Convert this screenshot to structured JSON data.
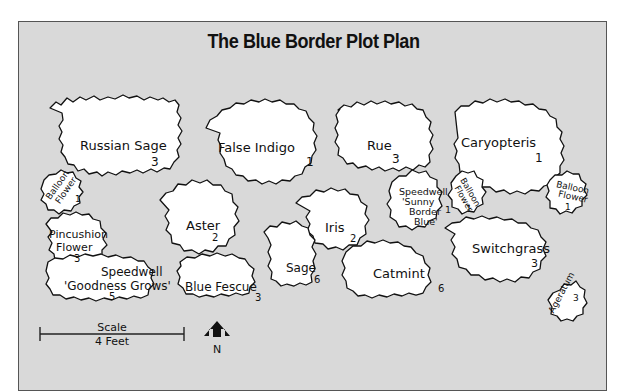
{
  "title": "The Blue Border Plot Plan",
  "colors": {
    "background": "#d9d9d9",
    "plant_fill": "#ffffff",
    "outline": "#111111",
    "frame_border": "#555555"
  },
  "plants": [
    {
      "id": "russian-sage",
      "name": "Russian Sage",
      "count": "3"
    },
    {
      "id": "false-indigo",
      "name": "False Indigo",
      "count": "1"
    },
    {
      "id": "rue",
      "name": "Rue",
      "count": "3"
    },
    {
      "id": "caryopteris",
      "name": "Caryopteris",
      "count": "1"
    },
    {
      "id": "balloon-flower-left",
      "name_lines": [
        "Balloon",
        "Flower"
      ],
      "count": "1"
    },
    {
      "id": "pincushion-flower",
      "name_lines": [
        "Pincushion",
        "Flower"
      ],
      "count": "3"
    },
    {
      "id": "aster",
      "name": "Aster",
      "count": "2"
    },
    {
      "id": "iris",
      "name": "Iris",
      "count": "2"
    },
    {
      "id": "speedwell-sunny",
      "name_lines": [
        "Speedwell",
        "'Sunny",
        "Border",
        "Blue'"
      ],
      "count": "1"
    },
    {
      "id": "balloon-flower-mid",
      "name_lines": [
        "Balloon",
        "Flower"
      ],
      "count": "1"
    },
    {
      "id": "balloon-flower-right",
      "name_lines": [
        "Balloon",
        "Flower"
      ],
      "count": "1"
    },
    {
      "id": "switchgrass",
      "name": "Switchgrass",
      "count": "3"
    },
    {
      "id": "speedwell-goodness",
      "name_lines": [
        "Speedwell",
        "'Goodness Grows'"
      ],
      "count": "5"
    },
    {
      "id": "blue-fescue",
      "name": "Blue Fescue",
      "count": "3"
    },
    {
      "id": "sage",
      "name": "Sage",
      "count": "6"
    },
    {
      "id": "catmint",
      "name": "Catmint",
      "count": "6"
    },
    {
      "id": "ageratum",
      "name": "Ageratum",
      "count": "3"
    }
  ],
  "scale": {
    "label": "Scale",
    "value": "4 Feet"
  },
  "compass": {
    "label": "N"
  }
}
